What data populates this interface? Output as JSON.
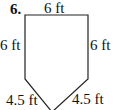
{
  "problem": {
    "number": "6.",
    "labels": {
      "top": "6 ft",
      "left": "6 ft",
      "right": "6 ft",
      "bottom_left": "4.5 ft",
      "bottom_right": "4.5 ft"
    }
  },
  "shape": {
    "type": "pentagon",
    "stroke": "#222222"
  }
}
